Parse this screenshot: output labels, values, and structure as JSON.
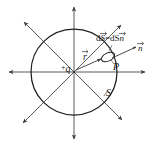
{
  "figure": {
    "background_color": "#ffffff",
    "line_color": "#4d4d4d",
    "circle_color": "#262626",
    "text_color": "#1a1a1a"
  },
  "labels": {
    "charge_sign": "+",
    "charge_symbol": "q",
    "radius_vector": "r",
    "point": "P",
    "surface": "S",
    "normal_vector": "n",
    "flux_element_lhs": "dS",
    "flux_element_equals": "=",
    "flux_element_rhs_scalar": "dS",
    "flux_element_rhs_vector": "n",
    "flux_element_full": "dS=dSn"
  },
  "geometry": {
    "center_x": 74,
    "center_y": 72,
    "circle_radius": 43,
    "field_line_count": 8,
    "field_line_directions": [
      0,
      45,
      90,
      135,
      180,
      225,
      270,
      315
    ],
    "patch_center_x": 108,
    "patch_center_y": 57,
    "patch_rx": 7,
    "patch_ry": 4,
    "patch_rotation_deg": -25
  },
  "icons": {
    "field_arrow": "arrow-head-icon",
    "gaussian_surface": "circle-outline-icon",
    "surface_patch": "ellipse-patch-icon",
    "normal_arrow": "normal-vector-arrow-icon",
    "radius_arrow": "radius-vector-arrow-icon",
    "point_charge": "point-charge-icon"
  }
}
